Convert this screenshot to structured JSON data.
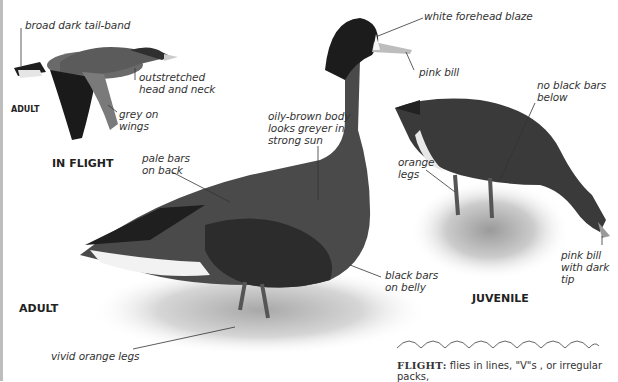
{
  "figure": {
    "tone": "grayscale",
    "captions": {
      "in_flight_adult": "ADULT",
      "in_flight": "IN FLIGHT",
      "adult": "ADULT",
      "juvenile": "JUVENILE"
    },
    "labels": {
      "tail_band": "broad dark tail-band",
      "head_neck": "outstretched\nhead and neck",
      "grey_wings": "grey on\nwings",
      "forehead": "white forehead blaze",
      "pink_bill": "pink bill",
      "body": "oily-brown body\nlooks greyer in\nstrong sun",
      "pale_bars": "pale bars\non back",
      "no_black_bars": "no black bars\nbelow",
      "orange_legs": "orange\nlegs",
      "black_bars": "black bars\non belly",
      "juv_bill": "pink bill\nwith dark\ntip",
      "vivid_legs": "vivid orange legs"
    },
    "footer": {
      "heading": "FLIGHT:",
      "text": " flies in lines, \"V\"s , or irregular packs,"
    }
  },
  "colors": {
    "ink": "#333333",
    "bird_dark": "#2b2b2b",
    "bird_mid": "#5a5a5a",
    "ground": "#cfcfcf"
  }
}
